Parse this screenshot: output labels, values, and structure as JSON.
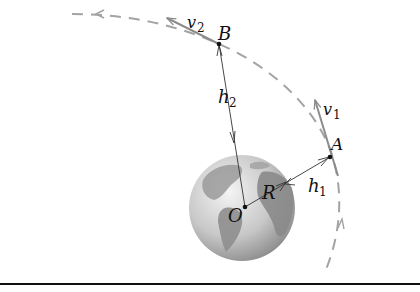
{
  "diagram": {
    "labels": {
      "B": "B",
      "A": "A",
      "O": "O",
      "R": "R",
      "v2": "v",
      "v2_sub": "2",
      "v1": "v",
      "v1_sub": "1",
      "h2": "h",
      "h2_sub": "2",
      "h1": "h",
      "h1_sub": "1"
    },
    "colors": {
      "orbit": "#a0a0a0",
      "velocity": "#8c8c8c",
      "line": "#333333",
      "earth_light": "#e6e6e6",
      "earth_dark": "#8a8a8a",
      "border": "#111111"
    }
  }
}
